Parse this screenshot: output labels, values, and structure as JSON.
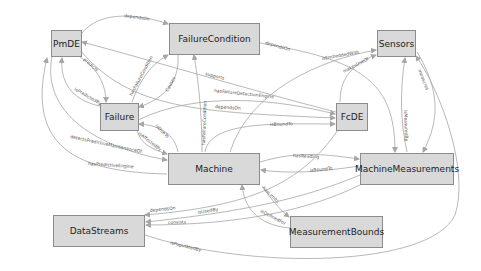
{
  "diagram": {
    "type": "ontology-graph",
    "colors": {
      "node_fill": "#d9d9d9",
      "node_border": "#8c8c8c",
      "edge": "#a6a6a6",
      "label": "#555555"
    },
    "nodes": {
      "pmde": "PmDE",
      "failure_condition": "FailureCondition",
      "sensors": "Sensors",
      "failure": "Failure",
      "fcde": "FcDE",
      "machine": "Machine",
      "machine_measurements": "MachineMeasurements",
      "data_streams": "DataStreams",
      "measurement_bounds": "MeasurementBounds"
    },
    "edges": [
      {
        "from": "PmDE",
        "to": "FailureCondition",
        "label": "dependsOn"
      },
      {
        "from": "PmDE",
        "to": "Failure",
        "label": "predicts"
      },
      {
        "from": "Failure",
        "to": "PmDE",
        "label": "isPredictedBy"
      },
      {
        "from": "Failure",
        "to": "FailureCondition",
        "label": "hasFailureCondition"
      },
      {
        "from": "FailureCondition",
        "to": "Failure",
        "label": "Causes"
      },
      {
        "from": "FcDE",
        "to": "PmDE",
        "label": "supports"
      },
      {
        "from": "Failure",
        "to": "FcDE",
        "label": "hasFailureDetectionEngine"
      },
      {
        "from": "Failure",
        "to": "FcDE",
        "label": "dependsOn"
      },
      {
        "from": "FailureCondition",
        "to": "MachineMeasurements",
        "label": "dependsOn"
      },
      {
        "from": "Machine",
        "to": "Sensors",
        "label": "isEmbeddedWith"
      },
      {
        "from": "FcDE",
        "to": "Sensors",
        "label": "makesUseOf"
      },
      {
        "from": "Sensors",
        "to": "MachineMeasurements",
        "label": "measures"
      },
      {
        "from": "MachineMeasurements",
        "to": "Sensors",
        "label": "isMeasuredBy"
      },
      {
        "from": "Machine",
        "to": "FcDE",
        "label": "isBoundTo"
      },
      {
        "from": "Machine",
        "to": "Failure",
        "label": "isDueTo"
      },
      {
        "from": "Failure",
        "to": "Machine",
        "label": "isAffectedBy"
      },
      {
        "from": "Machine",
        "to": "FailureCondition",
        "label": "hasFailureCondition"
      },
      {
        "from": "PmDE",
        "to": "Machine",
        "label": "detectsPredictiveMaintenanceOf"
      },
      {
        "from": "Machine",
        "to": "PmDE",
        "label": "hasPredictiveEngine"
      },
      {
        "from": "Machine",
        "to": "MachineMeasurements",
        "label": "hasReading"
      },
      {
        "from": "MachineMeasurements",
        "to": "Machine",
        "label": "isBoundTo"
      },
      {
        "from": "Machine",
        "to": "MeasurementBounds",
        "label": "hasLimits"
      },
      {
        "from": "MeasurementBounds",
        "to": "Machine",
        "label": "isDefinedFor"
      },
      {
        "from": "FcDE",
        "to": "DataStreams",
        "label": "dependsOn"
      },
      {
        "from": "MachineMeasurements",
        "to": "DataStreams",
        "label": "isUsedBy"
      },
      {
        "from": "MachineMeasurements",
        "to": "DataStreams",
        "label": "consists"
      },
      {
        "from": "DataStreams",
        "to": "Sensors",
        "label": "isPopulatedBy"
      }
    ]
  }
}
